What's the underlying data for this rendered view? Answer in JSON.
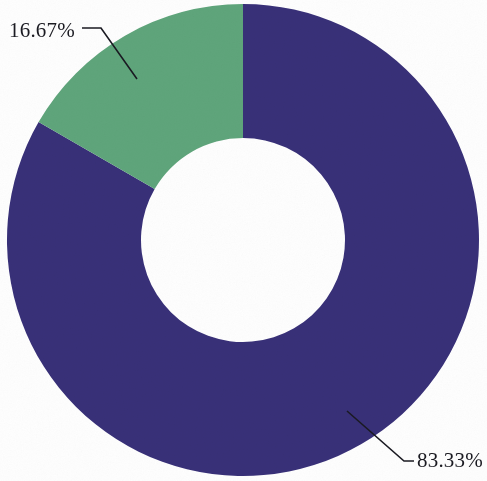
{
  "chart_data": {
    "type": "pie",
    "variant": "donut",
    "title": "",
    "subtitle": "",
    "xlabel": "",
    "ylabel": "",
    "legend_position": "none",
    "grid": false,
    "hole_ratio": 0.43,
    "start_angle_deg": 0,
    "direction": "counterclockwise",
    "categories": [
      "Segment A",
      "Segment B"
    ],
    "values": [
      83.33,
      16.67
    ],
    "labels": [
      "83.33%",
      "16.67%"
    ],
    "colors": [
      "#383078",
      "#5fa57b"
    ],
    "slices": [
      {
        "name": "Segment A",
        "value": 83.33,
        "label": "83.33%",
        "color": "#383078",
        "angle_deg": 300.0,
        "label_position": "bottom-right"
      },
      {
        "name": "Segment B",
        "value": 16.67,
        "label": "16.67%",
        "color": "#5fa57b",
        "angle_deg": 60.0,
        "label_position": "top-left"
      }
    ],
    "annotations": [
      {
        "text": "16.67%",
        "target": "Segment B",
        "leader": true
      },
      {
        "text": "83.33%",
        "target": "Segment A",
        "leader": true
      }
    ],
    "total": 100.0,
    "units": "percent"
  },
  "figure": {
    "background_color": "#fefefe",
    "label_color": "#1b1b22",
    "leader_color": "#1a1a22",
    "center_x": 243,
    "center_y": 240,
    "outer_radius": 236,
    "inner_radius": 102
  }
}
